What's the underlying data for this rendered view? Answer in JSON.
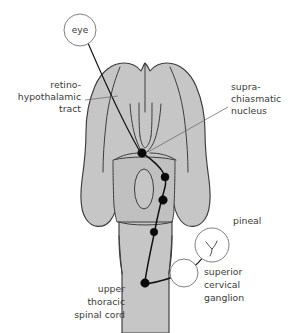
{
  "figure": {
    "background_color": "#ffffff",
    "brain_fill_color": "#c6c6c6",
    "outline_color": "#3d3d3d",
    "nerve_color": "#101010",
    "leader_color": "#6e6e6e",
    "label_color": "#3a3a3a"
  },
  "callouts": {
    "eye": {
      "label": "eye",
      "cx": 80,
      "cy": 30,
      "r": 16
    },
    "pineal": {
      "label": "pineal",
      "cx": 212,
      "cy": 245,
      "r": 17,
      "text_x": 233,
      "text_y": 224
    },
    "superior_cervical_ganglion": {
      "label_line1": "superior",
      "label_line2": "cervical",
      "label_line3": "ganglion",
      "cx": 184,
      "cy": 273,
      "r": 14,
      "text_x": 204,
      "text_y": 275
    }
  },
  "labels": {
    "retinohypothalamic_tract": {
      "line1": "retino-",
      "line2": "hypothalamic",
      "line3": "tract",
      "anchor_x": 81,
      "y1": 88,
      "y2": 100,
      "y3": 112
    },
    "suprachiasmatic_nucleus": {
      "line1": "supra-",
      "line2": "chiasmatic",
      "line3": "nucleus",
      "anchor_x": 231,
      "y1": 90,
      "y2": 102,
      "y3": 114
    },
    "upper_thoracic_spinal_cord": {
      "line1": "upper",
      "line2": "thoracic",
      "line3": "spinal cord",
      "anchor_x": 125,
      "y1": 292,
      "y2": 305,
      "y3": 318
    }
  },
  "nodes": [
    {
      "name": "suprachiasmatic-nucleus-node",
      "cx": 142,
      "cy": 153,
      "r": 4.3
    },
    {
      "name": "spinal-relay-node-1",
      "cx": 165,
      "cy": 177,
      "r": 4.0
    },
    {
      "name": "spinal-relay-node-2",
      "cx": 163,
      "cy": 200,
      "r": 4.3
    },
    {
      "name": "spinal-relay-node-3",
      "cx": 154,
      "cy": 232,
      "r": 3.8
    },
    {
      "name": "spinal-cord-terminal-node",
      "cx": 145,
      "cy": 283,
      "r": 4.3
    },
    {
      "name": "superior-cervical-ganglion-node",
      "cx": 184,
      "cy": 273,
      "r": 3.8
    }
  ]
}
